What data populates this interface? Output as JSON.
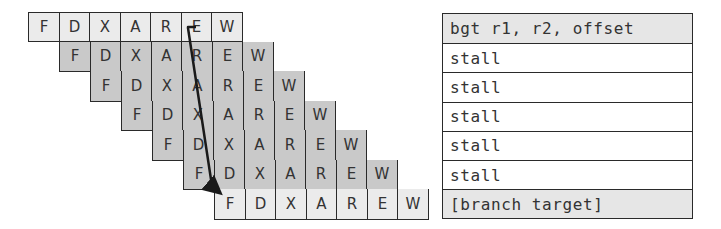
{
  "pipeline": {
    "stages": [
      "F",
      "D",
      "X",
      "A",
      "R",
      "E",
      "W"
    ],
    "rows": [
      {
        "label_index": 0,
        "offset": 0,
        "shade": "light",
        "stages": [
          "F",
          "D",
          "X",
          "A",
          "R",
          "E",
          "W"
        ]
      },
      {
        "label_index": 1,
        "offset": 1,
        "shade": "dark",
        "stages": [
          "F",
          "D",
          "X",
          "A",
          "R",
          "E",
          "W"
        ]
      },
      {
        "label_index": 2,
        "offset": 2,
        "shade": "dark",
        "stages": [
          "F",
          "D",
          "X",
          "A",
          "R",
          "E",
          "W"
        ]
      },
      {
        "label_index": 3,
        "offset": 3,
        "shade": "dark",
        "stages": [
          "F",
          "D",
          "X",
          "A",
          "R",
          "E",
          "W"
        ]
      },
      {
        "label_index": 4,
        "offset": 4,
        "shade": "dark",
        "stages": [
          "F",
          "D",
          "X",
          "A",
          "R",
          "E",
          "W"
        ]
      },
      {
        "label_index": 5,
        "offset": 5,
        "shade": "dark",
        "stages": [
          "F",
          "D",
          "X",
          "A",
          "R",
          "E",
          "W"
        ]
      },
      {
        "label_index": 6,
        "offset": 6,
        "shade": "light",
        "stages": [
          "F",
          "D",
          "X",
          "A",
          "R",
          "E",
          "W"
        ]
      }
    ],
    "arrow": {
      "from": "row0-E",
      "to": "row6-F",
      "meaning": "branch-resolved-to-target-fetch"
    }
  },
  "instructions": [
    {
      "text": "bgt r1, r2, offset",
      "shaded": true
    },
    {
      "text": "stall",
      "shaded": false
    },
    {
      "text": "stall",
      "shaded": false
    },
    {
      "text": "stall",
      "shaded": false
    },
    {
      "text": "stall",
      "shaded": false
    },
    {
      "text": "stall",
      "shaded": false
    },
    {
      "text": "[branch target]",
      "shaded": true
    }
  ],
  "colors": {
    "light_cell": "#ebebeb",
    "dark_cell": "#c9c9c9",
    "border": "#2a2a2a",
    "arrow": "#1a1a1a"
  }
}
